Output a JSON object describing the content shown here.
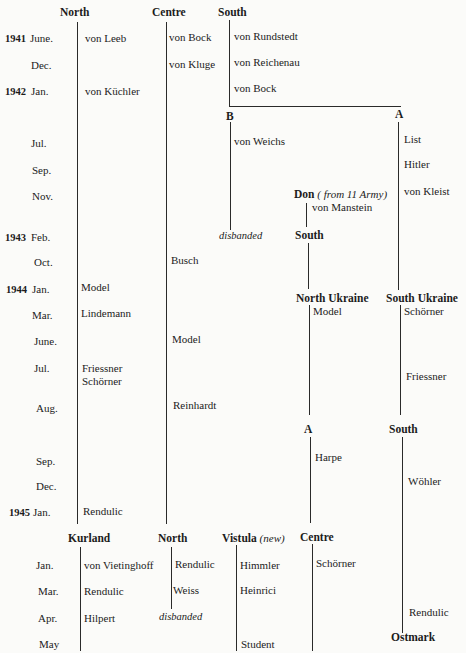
{
  "columns": {
    "north": "North",
    "centre": "Centre",
    "south": "South",
    "b": "B",
    "a": "A",
    "don": "Don",
    "don_note": "( from 11 Army)",
    "south2": "South",
    "north_ukraine": "North Ukraine",
    "south_ukraine": "South Ukraine",
    "a2": "A",
    "south3": "South",
    "kurland": "Kurland",
    "north2": "North",
    "vistula": "Vistula",
    "vistula_note": "(new)",
    "centre2": "Centre",
    "ostmark": "Ostmark"
  },
  "dates": [
    {
      "year": "1941",
      "month": "June."
    },
    {
      "year": "",
      "month": "Dec."
    },
    {
      "year": "1942",
      "month": "Jan."
    },
    {
      "year": "",
      "month": "Jul."
    },
    {
      "year": "",
      "month": "Sep."
    },
    {
      "year": "",
      "month": "Nov."
    },
    {
      "year": "1943",
      "month": "Feb."
    },
    {
      "year": "",
      "month": "Oct."
    },
    {
      "year": "1944",
      "month": "Jan."
    },
    {
      "year": "",
      "month": "Mar."
    },
    {
      "year": "",
      "month": "June."
    },
    {
      "year": "",
      "month": "Jul."
    },
    {
      "year": "",
      "month": "Aug."
    },
    {
      "year": "",
      "month": "Sep."
    },
    {
      "year": "",
      "month": "Dec."
    },
    {
      "year": "1945",
      "month": "Jan."
    },
    {
      "year": "",
      "month": "Jan."
    },
    {
      "year": "",
      "month": "Mar."
    },
    {
      "year": "",
      "month": "Apr."
    },
    {
      "year": "",
      "month": "May"
    }
  ],
  "commanders": {
    "north": [
      "von Leeb",
      "von Küchler",
      "Model",
      "Lindemann",
      "Friessner",
      "Schörner",
      "Rendulic"
    ],
    "centre": [
      "von Bock",
      "von Kluge",
      "Busch",
      "Model",
      "Reinhardt"
    ],
    "south": [
      "von Rundstedt",
      "von Reichenau",
      "von Bock"
    ],
    "b": [
      "von Weichs"
    ],
    "b_end": "disbanded",
    "a": [
      "List",
      "Hitler",
      "von Kleist"
    ],
    "don": [
      "von Manstein"
    ],
    "north_ukraine": [
      "Model"
    ],
    "south_ukraine": [
      "Schörner",
      "Friessner"
    ],
    "a2": [
      "Harpe"
    ],
    "south3": [
      "Wöhler",
      "Rendulic"
    ],
    "kurland": [
      "von Vietinghoff",
      "Rendulic",
      "Hilpert"
    ],
    "north2": [
      "Rendulic",
      "Weiss"
    ],
    "north2_end": "disbanded",
    "vistula": [
      "Himmler",
      "Heinrici",
      "Student"
    ],
    "centre2": [
      "Schörner"
    ]
  }
}
